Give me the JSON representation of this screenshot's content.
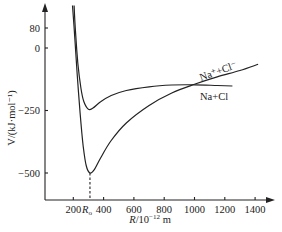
{
  "chart_data": {
    "type": "line",
    "title": "",
    "xlabel": "R/10^-12 m",
    "ylabel": "V/(kJ·mol^-1)",
    "xlim": [
      0,
      1500
    ],
    "ylim": [
      -600,
      170
    ],
    "grid": false,
    "x_ticks": [
      {
        "value": 200,
        "label": "200"
      },
      {
        "value": 310,
        "label": "R0"
      },
      {
        "value": 400,
        "label": "400"
      },
      {
        "value": 600,
        "label": "600"
      },
      {
        "value": 800,
        "label": "800"
      },
      {
        "value": 1000,
        "label": "1000"
      },
      {
        "value": 1200,
        "label": "1200"
      },
      {
        "value": 1400,
        "label": "1400"
      }
    ],
    "y_ticks": [
      {
        "value": 80,
        "label": "80"
      },
      {
        "value": 0,
        "label": "0"
      },
      {
        "value": -250,
        "label": "-250"
      },
      {
        "value": -500,
        "label": "-500"
      }
    ],
    "series": [
      {
        "name": "Na+Cl",
        "label": "Na+Cl",
        "points": [
          [
            205,
            170
          ],
          [
            215,
            60
          ],
          [
            230,
            -60
          ],
          [
            250,
            -160
          ],
          [
            270,
            -215
          ],
          [
            300,
            -245
          ],
          [
            330,
            -240
          ],
          [
            380,
            -215
          ],
          [
            450,
            -190
          ],
          [
            550,
            -170
          ],
          [
            700,
            -155
          ],
          [
            850,
            -148
          ],
          [
            1000,
            -147
          ],
          [
            1150,
            -150
          ],
          [
            1250,
            -152
          ]
        ]
      },
      {
        "name": "Na+ + Cl-",
        "label": "Na⁺+Cl⁻",
        "points": [
          [
            195,
            170
          ],
          [
            210,
            40
          ],
          [
            225,
            -100
          ],
          [
            245,
            -260
          ],
          [
            265,
            -390
          ],
          [
            285,
            -470
          ],
          [
            310,
            -500
          ],
          [
            340,
            -485
          ],
          [
            380,
            -440
          ],
          [
            450,
            -370
          ],
          [
            550,
            -300
          ],
          [
            700,
            -230
          ],
          [
            850,
            -180
          ],
          [
            1000,
            -145
          ],
          [
            1150,
            -115
          ],
          [
            1300,
            -90
          ],
          [
            1420,
            -65
          ]
        ]
      }
    ],
    "annotations": [
      {
        "text": "Ro dashed drop line",
        "x": 310,
        "y_from": -500,
        "y_to": -600
      }
    ]
  },
  "labels": {
    "y_axis": "V/(kJ·mol⁻¹)",
    "x_axis_R": "R",
    "x_axis_rest": "/10",
    "x_axis_exp": "−12",
    "x_axis_unit": " m",
    "series_upper": "Na⁺+Cl⁻",
    "series_lower": "Na+Cl",
    "ro": "R",
    "ro_sub": "o"
  },
  "style": {
    "line_color": "#222222",
    "background": "#ffffff"
  }
}
